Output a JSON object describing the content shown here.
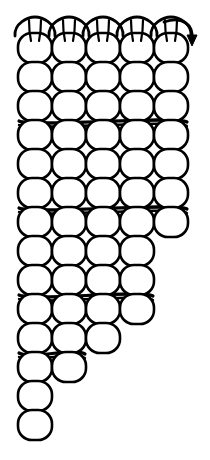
{
  "figure": {
    "background_color": "#ffffff",
    "stroke_color": "#000000",
    "fill_color": "#ffffff",
    "width": 210,
    "height": 460
  },
  "caption": {
    "text": "",
    "color": "#b8b8b8",
    "visible": false,
    "note": "faint clipped text at bottom edge, illegible"
  },
  "arrow": {
    "name": "yarn-direction-arrow",
    "position": "top-right",
    "direction": "down-right",
    "x": 186,
    "y": 34
  },
  "bind_off": {
    "name": "top-chain-row",
    "loop_count": 5,
    "y": 26,
    "description": "chain of bind-off loops across top edge"
  },
  "chart_data": {
    "type": "diagram",
    "columns": 5,
    "column_centers": [
      35,
      69,
      103,
      137,
      171
    ],
    "column_width": 34,
    "loop_rx": 17,
    "loop_ry": 15,
    "row_pitch": 29,
    "rows": [
      {
        "index": 0,
        "y": 48,
        "columns": [
          0,
          1,
          2,
          3,
          4
        ],
        "connector": false
      },
      {
        "index": 1,
        "y": 77,
        "columns": [
          0,
          1,
          2,
          3,
          4
        ],
        "connector": false
      },
      {
        "index": 2,
        "y": 106,
        "columns": [
          0,
          1,
          2,
          3,
          4
        ],
        "connector": false
      },
      {
        "index": 3,
        "y": 135,
        "columns": [
          0,
          1,
          2,
          3,
          4
        ],
        "connector": true
      },
      {
        "index": 4,
        "y": 164,
        "columns": [
          0,
          1,
          2,
          3,
          4
        ],
        "connector": false
      },
      {
        "index": 5,
        "y": 193,
        "columns": [
          0,
          1,
          2,
          3,
          4
        ],
        "connector": false
      },
      {
        "index": 6,
        "y": 222,
        "columns": [
          0,
          1,
          2,
          3,
          4
        ],
        "connector": true
      },
      {
        "index": 7,
        "y": 251,
        "columns": [
          0,
          1,
          2,
          3
        ],
        "connector": false
      },
      {
        "index": 8,
        "y": 280,
        "columns": [
          0,
          1,
          2,
          3
        ],
        "connector": false
      },
      {
        "index": 9,
        "y": 309,
        "columns": [
          0,
          1,
          2,
          3
        ],
        "connector": true
      },
      {
        "index": 10,
        "y": 338,
        "columns": [
          0,
          1,
          2
        ],
        "connector": false
      },
      {
        "index": 11,
        "y": 367,
        "columns": [
          0,
          1
        ],
        "connector": true
      },
      {
        "index": 12,
        "y": 396,
        "columns": [
          0
        ],
        "connector": false
      },
      {
        "index": 13,
        "y": 425,
        "columns": [
          0
        ],
        "connector": false
      }
    ],
    "xlabel": "",
    "ylabel": "",
    "legend": []
  }
}
